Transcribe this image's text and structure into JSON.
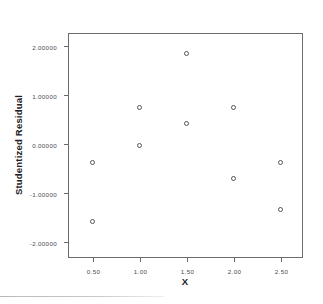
{
  "chart_data": {
    "type": "scatter",
    "title": "",
    "xlabel": "X",
    "ylabel": "Studentized Residual",
    "xlim": [
      0.25,
      2.75
    ],
    "ylim": [
      -2.35,
      2.25
    ],
    "grid": false,
    "legend": false,
    "marker": "open-circle",
    "x_ticks": [
      "0.50",
      "1.00",
      "1.50",
      "2.00",
      "2.50"
    ],
    "x_tick_values": [
      0.5,
      1.0,
      1.5,
      2.0,
      2.5
    ],
    "y_ticks": [
      "2.00000",
      "1.00000",
      "0.00000",
      "-1.00000",
      "-2.00000"
    ],
    "y_tick_values": [
      2,
      1,
      0,
      -1,
      -2
    ],
    "points": [
      {
        "x": 0.5,
        "y": -0.37
      },
      {
        "x": 0.5,
        "y": -1.58
      },
      {
        "x": 1.0,
        "y": 0.75
      },
      {
        "x": 1.0,
        "y": -0.02
      },
      {
        "x": 1.5,
        "y": 1.86
      },
      {
        "x": 1.5,
        "y": 0.43
      },
      {
        "x": 2.0,
        "y": 0.75
      },
      {
        "x": 2.0,
        "y": -0.7
      },
      {
        "x": 2.5,
        "y": -0.38
      },
      {
        "x": 2.5,
        "y": -1.33
      }
    ],
    "colors": {
      "marker_stroke": "#55555a",
      "axis": "#6b6b6b",
      "tick_label": "#4a4a4f",
      "axis_title": "#212125",
      "background": "#ffffff"
    }
  }
}
